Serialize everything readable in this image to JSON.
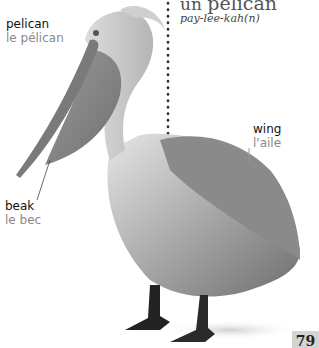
{
  "heading": {
    "article": "un",
    "word": "pélican",
    "pronunciation": "pay-lee-kah(n)"
  },
  "labels": {
    "bird": {
      "english": "pelican",
      "french": "le pélican"
    },
    "wing": {
      "english": "wing",
      "french": "l'aile"
    },
    "beak": {
      "english": "beak",
      "french": "le bec"
    }
  },
  "page_number": "79",
  "image": {
    "subject": "pelican-photo",
    "colors": {
      "background": "#ffffff",
      "label_french": "#8a8a8a",
      "page_tab": "#d4d4d4"
    }
  }
}
